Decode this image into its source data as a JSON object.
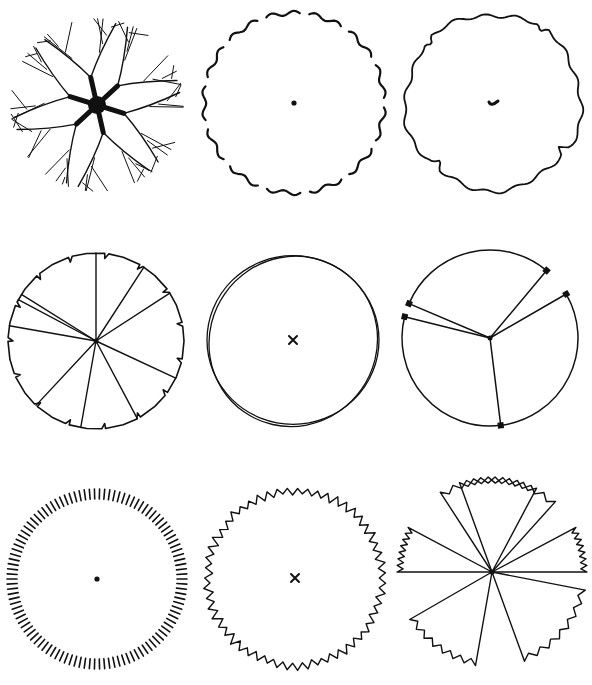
{
  "diagram": {
    "title": "",
    "background": "#ffffff",
    "ink_color": "#111111",
    "layout": {
      "rows": 3,
      "cols": 3
    },
    "symbols": [
      {
        "id": "tree-branching-canopy",
        "row": 1,
        "col": 1,
        "cx": 97,
        "cy": 105,
        "r": 88,
        "style": "branching-canopy",
        "center_mark": "solid-trunk"
      },
      {
        "id": "tree-broken-wavy-outline",
        "row": 1,
        "col": 2,
        "cx": 294,
        "cy": 103,
        "r": 90,
        "style": "broken-wavy-outline",
        "center_mark": "dot"
      },
      {
        "id": "tree-irregular-wavy-outline",
        "row": 1,
        "col": 3,
        "cx": 493,
        "cy": 102,
        "r": 88,
        "style": "irregular-wavy-outline",
        "center_mark": "tick"
      },
      {
        "id": "tree-notched-segments",
        "row": 2,
        "col": 1,
        "cx": 96,
        "cy": 341,
        "r": 88,
        "style": "notched-outline-with-radial-spokes",
        "spokes": 10,
        "center_mark": "dot"
      },
      {
        "id": "tree-double-outline",
        "row": 2,
        "col": 2,
        "cx": 293,
        "cy": 340,
        "r": 86,
        "style": "double-overlapping-outline",
        "center_mark": "x"
      },
      {
        "id": "tree-three-arc-spokes",
        "row": 2,
        "col": 3,
        "cx": 490,
        "cy": 338,
        "r": 88,
        "style": "arcs-with-spokes",
        "spokes": 5,
        "center_mark": "dot"
      },
      {
        "id": "tree-hatched-ring",
        "row": 3,
        "col": 1,
        "cx": 97,
        "cy": 579,
        "r": 90,
        "style": "radial-hatched-ring",
        "ticks": 110,
        "center_mark": "dot"
      },
      {
        "id": "tree-zigzag-outline",
        "row": 3,
        "col": 2,
        "cx": 295,
        "cy": 578,
        "r": 92,
        "style": "jagged-zigzag-outline",
        "center_mark": "x"
      },
      {
        "id": "tree-zigzag-wedges",
        "row": 3,
        "col": 3,
        "cx": 492,
        "cy": 572,
        "r": 95,
        "style": "zigzag-wedges-with-spokes",
        "wedges": 6,
        "center_mark": "dot"
      }
    ]
  }
}
